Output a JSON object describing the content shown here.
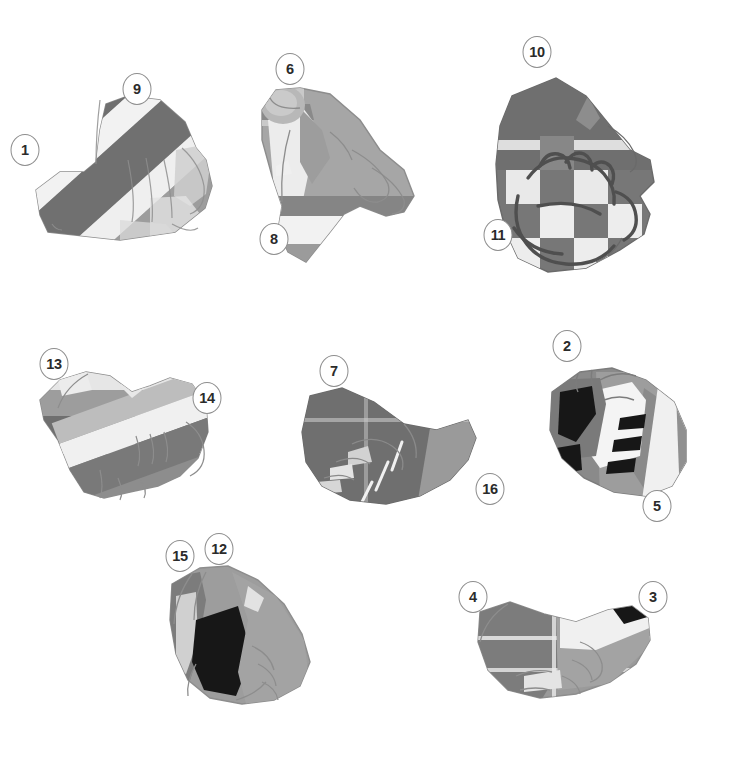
{
  "figure": {
    "background_color": "#ffffff",
    "canvas": {
      "width": 735,
      "height": 777
    },
    "palette": {
      "white": "#f4f4f4",
      "light": "#d8d8d8",
      "mid_light": "#bdbdbd",
      "mid": "#a3a3a3",
      "mid_dark": "#8c8c8c",
      "dark": "#6f6f6f",
      "darker": "#5f5f5f",
      "black": "#141414",
      "outline": "#8d8d8d",
      "callout_stroke": "#8d8d8d",
      "callout_text": "#2b2b2b"
    },
    "callouts": [
      {
        "id": "callout-1",
        "label": "1",
        "x": 25,
        "y": 150
      },
      {
        "id": "callout-9",
        "label": "9",
        "x": 137,
        "y": 89
      },
      {
        "id": "callout-6",
        "label": "6",
        "x": 290,
        "y": 69
      },
      {
        "id": "callout-8",
        "label": "8",
        "x": 274,
        "y": 239
      },
      {
        "id": "callout-10",
        "label": "10",
        "x": 537,
        "y": 52
      },
      {
        "id": "callout-11",
        "label": "11",
        "x": 498,
        "y": 235
      },
      {
        "id": "callout-13",
        "label": "13",
        "x": 54,
        "y": 364
      },
      {
        "id": "callout-14",
        "label": "14",
        "x": 207,
        "y": 398
      },
      {
        "id": "callout-7",
        "label": "7",
        "x": 334,
        "y": 371
      },
      {
        "id": "callout-16",
        "label": "16",
        "x": 490,
        "y": 489
      },
      {
        "id": "callout-2",
        "label": "2",
        "x": 567,
        "y": 346
      },
      {
        "id": "callout-5",
        "label": "5",
        "x": 657,
        "y": 506
      },
      {
        "id": "callout-15",
        "label": "15",
        "x": 180,
        "y": 556
      },
      {
        "id": "callout-12",
        "label": "12",
        "x": 219,
        "y": 549
      },
      {
        "id": "callout-4",
        "label": "4",
        "x": 473,
        "y": 597
      },
      {
        "id": "callout-3",
        "label": "3",
        "x": 653,
        "y": 597
      }
    ],
    "gloves": [
      {
        "id": "glove-top-left",
        "name": "striped-mitt-front",
        "refs": [
          "1",
          "9"
        ],
        "pattern": "diagonal-stripes"
      },
      {
        "id": "glove-top-center",
        "name": "open-finger-glove",
        "refs": [
          "6",
          "8"
        ],
        "pattern": "banded"
      },
      {
        "id": "glove-top-right",
        "name": "checkered-glove",
        "refs": [
          "10",
          "11"
        ],
        "pattern": "checker"
      },
      {
        "id": "glove-mid-left",
        "name": "banded-mitt",
        "refs": [
          "13",
          "14"
        ],
        "pattern": "horizontal-bands"
      },
      {
        "id": "glove-mid-center",
        "name": "dark-glove",
        "refs": [
          "7",
          "16"
        ],
        "pattern": "dark-solid"
      },
      {
        "id": "glove-mid-right",
        "name": "cutout-glove",
        "refs": [
          "2",
          "5"
        ],
        "pattern": "cutouts"
      },
      {
        "id": "glove-bottom-left",
        "name": "patch-glove",
        "refs": [
          "15",
          "12"
        ],
        "pattern": "black-patch"
      },
      {
        "id": "glove-bottom-right",
        "name": "wristband-glove",
        "refs": [
          "4",
          "3"
        ],
        "pattern": "wrist-band"
      }
    ]
  }
}
